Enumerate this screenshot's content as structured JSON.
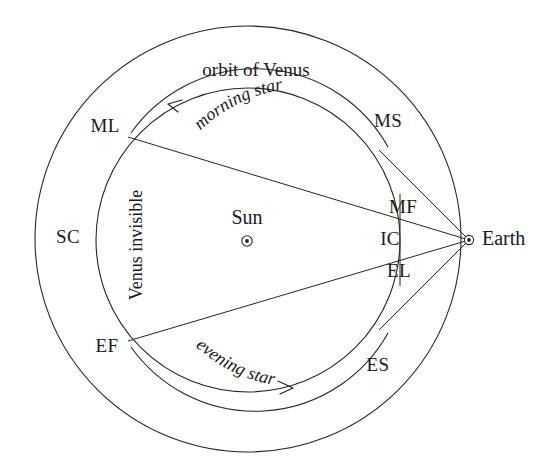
{
  "diagram": {
    "title": "orbit of Venus",
    "bodies": [
      {
        "id": "sun",
        "label": "Sun",
        "marker": "circled-dot-icon",
        "x": 247,
        "y": 241,
        "label_x": 247,
        "label_y": 219
      },
      {
        "id": "earth",
        "label": "Earth",
        "marker": "circled-dot-icon",
        "x": 469,
        "y": 240,
        "label_x": 482,
        "label_y": 240
      }
    ],
    "orbit_points": [
      {
        "id": "ml",
        "label": "ML",
        "x": 128,
        "y": 137,
        "label_x": 105,
        "label_y": 128
      },
      {
        "id": "ms",
        "label": "MS",
        "x": 382,
        "y": 153,
        "label_x": 386,
        "label_y": 123
      },
      {
        "id": "mf",
        "label": "MF",
        "x": 399,
        "y": 196,
        "label_x": 401,
        "label_y": 208
      },
      {
        "id": "ic",
        "label": "IC",
        "x": 400,
        "y": 240,
        "label_x": 392,
        "label_y": 240
      },
      {
        "id": "el",
        "label": "EL",
        "x": 399,
        "y": 284,
        "label_x": 399,
        "label_y": 272
      },
      {
        "id": "es",
        "label": "ES",
        "x": 382,
        "y": 327,
        "label_x": 376,
        "label_y": 366
      },
      {
        "id": "ef",
        "label": "EF",
        "x": 128,
        "y": 341,
        "label_x": 106,
        "label_y": 347
      },
      {
        "id": "sc",
        "label": "SC",
        "x": 96,
        "y": 240,
        "label_x": 68,
        "label_y": 238
      }
    ],
    "arc_labels": [
      {
        "id": "morning-star",
        "text": "morning star"
      },
      {
        "id": "evening-star",
        "text": "evening star"
      }
    ],
    "vertical_label": "Venus invisible",
    "colors": {
      "stroke": "#262626",
      "text": "#1a1a1a",
      "background": "#ffffff"
    },
    "geometry": {
      "center_x": 248,
      "center_y": 240,
      "outer_radius": 213,
      "inner_radius": 152
    }
  }
}
